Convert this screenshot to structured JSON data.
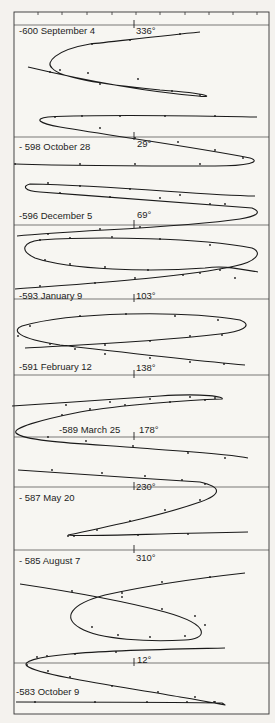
{
  "figure": {
    "frame": {
      "left": 14,
      "top": 12,
      "right": 269,
      "bottom": 714
    },
    "scale": {
      "y": 12,
      "ticks_x": [
        38,
        62,
        87,
        112,
        136,
        160,
        185,
        209,
        233,
        257
      ]
    },
    "separators_y": [
      25,
      137,
      225,
      299,
      375,
      437,
      487,
      550,
      663
    ],
    "center_tick_x": 134,
    "panels": [
      {
        "id": "p600",
        "date_label": "-600 September 4",
        "longitude_label": "336°",
        "label_x": 19,
        "label_y": 26,
        "deg_x": 136,
        "deg_y": 26,
        "tick_y": 25
      },
      {
        "id": "p598",
        "date_label": "- 598 October 28",
        "longitude_label": "29°",
        "label_x": 19,
        "label_y": 142,
        "deg_x": 137,
        "deg_y": 139,
        "tick_y": 137
      },
      {
        "id": "p596",
        "date_label": "-596 December 5",
        "longitude_label": "69°",
        "label_x": 19,
        "label_y": 211,
        "deg_x": 137,
        "deg_y": 210,
        "tick_y": 225
      },
      {
        "id": "p593",
        "date_label": "-593 January 9",
        "longitude_label": "103°",
        "label_x": 19,
        "label_y": 291,
        "deg_x": 136,
        "deg_y": 291,
        "tick_y": 299
      },
      {
        "id": "p591",
        "date_label": "-591 February 12",
        "longitude_label": "138°",
        "label_x": 19,
        "label_y": 362,
        "deg_x": 136,
        "deg_y": 363,
        "tick_y": 375
      },
      {
        "id": "p589",
        "date_label": "-589 March 25",
        "longitude_label": "178°",
        "label_x": 59,
        "label_y": 425,
        "deg_x": 139,
        "deg_y": 425,
        "tick_y": 437
      },
      {
        "id": "p587",
        "date_label": "- 587  May 20",
        "longitude_label": "230°",
        "label_x": 19,
        "label_y": 493,
        "deg_x": 136,
        "deg_y": 482,
        "tick_y": 487
      },
      {
        "id": "p585",
        "date_label": "- 585  August 7",
        "longitude_label": "310°",
        "label_x": 19,
        "label_y": 556,
        "deg_x": 136,
        "deg_y": 553,
        "tick_y": 550
      },
      {
        "id": "p583",
        "date_label": "-583 October 9",
        "longitude_label": "12°",
        "label_x": 16,
        "label_y": 687,
        "deg_x": 137,
        "deg_y": 655,
        "tick_y": 663
      }
    ],
    "curves": [
      {
        "name": "curve-600",
        "d": "M200 32 C160 36 110 42 90 44 C55 50 45 63 52 68 C60 78 100 84 160 90 C215 94 212 98 198 96 C150 92 100 84 28 67",
        "dots": [
          [
            180,
            34
          ],
          [
            130,
            40
          ],
          [
            92,
            44
          ],
          [
            60,
            70
          ],
          [
            88,
            73
          ],
          [
            138,
            79
          ],
          [
            172,
            91
          ],
          [
            200,
            95
          ],
          [
            100,
            84
          ],
          [
            50,
            72
          ]
        ]
      },
      {
        "name": "curve-598",
        "d": "M257 117 C200 116 110 114 48 117 C34 119 38 123 60 127 C120 137 200 148 250 158 C262 162 248 166 215 166 C160 166 80 166 15 164",
        "dots": [
          [
            55,
            117
          ],
          [
            82,
            116
          ],
          [
            120,
            116
          ],
          [
            165,
            116
          ],
          [
            215,
            116
          ],
          [
            100,
            128
          ],
          [
            135,
            138
          ],
          [
            178,
            142
          ],
          [
            215,
            150
          ],
          [
            243,
            158
          ],
          [
            15,
            164
          ],
          [
            80,
            164
          ],
          [
            135,
            164
          ],
          [
            200,
            164
          ]
        ]
      },
      {
        "name": "curve-596",
        "d": "M255 196 C200 195 120 186 30 184 C22 186 24 191 40 192 C120 198 210 205 252 208 C262 212 258 216 240 219 C180 228 80 230 17 236",
        "dots": [
          [
            48,
            183
          ],
          [
            80,
            186
          ],
          [
            130,
            189
          ],
          [
            180,
            195
          ],
          [
            225,
            204
          ],
          [
            60,
            193
          ],
          [
            110,
            197
          ],
          [
            160,
            198
          ],
          [
            210,
            204
          ],
          [
            48,
            234
          ],
          [
            100,
            229
          ],
          [
            140,
            227
          ]
        ]
      },
      {
        "name": "curve-593",
        "d": "M258 272 C230 267 220 266 205 268 C150 272 70 270 35 258 C18 250 24 242 40 240 C100 236 200 238 252 248 C264 253 255 262 235 266 C180 278 80 284 15 289",
        "dots": [
          [
            40,
            240
          ],
          [
            70,
            238
          ],
          [
            112,
            237
          ],
          [
            160,
            239
          ],
          [
            210,
            245
          ],
          [
            45,
            260
          ],
          [
            70,
            264
          ],
          [
            105,
            267
          ],
          [
            148,
            270
          ],
          [
            200,
            273
          ],
          [
            235,
            278
          ],
          [
            40,
            286
          ],
          [
            95,
            283
          ],
          [
            135,
            278
          ],
          [
            183,
            275
          ],
          [
            220,
            270
          ]
        ]
      },
      {
        "name": "curve-591",
        "d": "M245 365 C210 362 120 352 60 345 C15 338 12 330 22 326 C70 312 180 310 240 320 C255 326 240 332 220 334 C150 342 80 345 25 348",
        "dots": [
          [
            30,
            326
          ],
          [
            80,
            316
          ],
          [
            126,
            314
          ],
          [
            175,
            316
          ],
          [
            218,
            320
          ],
          [
            18,
            336
          ],
          [
            50,
            344
          ],
          [
            75,
            349
          ],
          [
            105,
            354
          ],
          [
            150,
            358
          ],
          [
            190,
            362
          ],
          [
            224,
            364
          ],
          [
            105,
            345
          ],
          [
            150,
            341
          ],
          [
            190,
            336
          ],
          [
            222,
            335
          ]
        ]
      },
      {
        "name": "curve-589",
        "d": "M12 406 C60 403 120 399 160 396 C205 393 225 397 222 399 C190 400 120 405 80 412 C40 420 12 428 16 433 C25 442 90 444 140 448 C190 452 230 454 248 458",
        "dots": [
          [
            66,
            405
          ],
          [
            110,
            402
          ],
          [
            150,
            399
          ],
          [
            190,
            397
          ],
          [
            215,
            398
          ],
          [
            205,
            400
          ],
          [
            170,
            402
          ],
          [
            125,
            405
          ],
          [
            90,
            409
          ],
          [
            62,
            415
          ],
          [
            48,
            437
          ],
          [
            86,
            441
          ],
          [
            133,
            446
          ],
          [
            188,
            453
          ],
          [
            225,
            458
          ]
        ]
      },
      {
        "name": "curve-587",
        "d": "M18 470 C70 474 140 478 200 482 C222 487 222 494 200 502 C160 516 110 526 68 535 C80 537 140 534 248 532",
        "dots": [
          [
            52,
            470
          ],
          [
            102,
            473
          ],
          [
            145,
            476
          ],
          [
            182,
            480
          ],
          [
            205,
            484
          ],
          [
            200,
            500
          ],
          [
            165,
            510
          ],
          [
            130,
            521
          ],
          [
            97,
            530
          ],
          [
            74,
            536
          ],
          [
            138,
            535
          ],
          [
            188,
            534
          ],
          [
            68,
            536
          ]
        ]
      },
      {
        "name": "curve-585",
        "d": "M20 584 C60 590 120 600 165 612 C215 626 205 640 185 640 C150 642 100 640 80 628 C62 618 70 604 105 595 C150 585 200 578 245 573",
        "dots": [
          [
            72,
            591
          ],
          [
            122,
            597
          ],
          [
            162,
            609
          ],
          [
            195,
            616
          ],
          [
            205,
            625
          ],
          [
            185,
            636
          ],
          [
            150,
            637
          ],
          [
            118,
            635
          ],
          [
            92,
            627
          ],
          [
            122,
            593
          ],
          [
            162,
            582
          ],
          [
            210,
            577
          ]
        ]
      },
      {
        "name": "curve-583",
        "d": "M225 648 C180 649 110 650 70 654 C35 657 22 662 27 666 C40 676 130 688 180 697 C230 705 228 707 222 703 C180 702 80 702 16 702",
        "dots": [
          [
            37,
            657
          ],
          [
            47,
            656
          ],
          [
            75,
            654
          ],
          [
            116,
            652
          ],
          [
            27,
            665
          ],
          [
            48,
            671
          ],
          [
            70,
            677
          ],
          [
            112,
            686
          ],
          [
            158,
            692
          ],
          [
            195,
            697
          ],
          [
            215,
            702
          ],
          [
            35,
            702
          ],
          [
            95,
            702
          ],
          [
            147,
            702
          ],
          [
            187,
            702
          ],
          [
            214,
            702
          ]
        ]
      }
    ]
  }
}
